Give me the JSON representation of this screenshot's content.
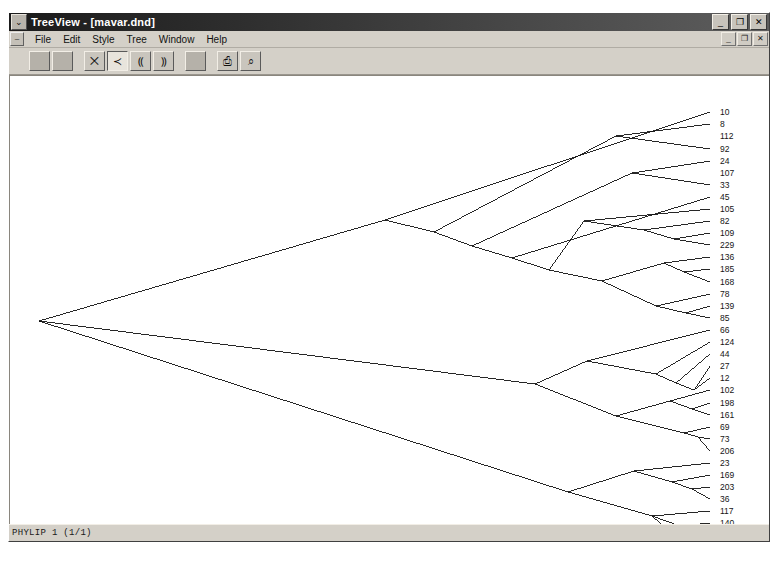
{
  "window": {
    "title": "TreeView - [mavar.dnd]",
    "app_name": "TreeView",
    "document_name": "mavar.dnd",
    "sysmenu_glyph": "⌄",
    "controls": [
      {
        "name": "minimize",
        "glyph": "_"
      },
      {
        "name": "restore",
        "glyph": "❐"
      },
      {
        "name": "close",
        "glyph": "✕"
      }
    ],
    "child_controls": [
      {
        "name": "child-minimize",
        "glyph": "_"
      },
      {
        "name": "child-restore",
        "glyph": "❐"
      },
      {
        "name": "child-close",
        "glyph": "✕"
      }
    ],
    "child_sysmenu_glyph": "–"
  },
  "menu": {
    "items": [
      {
        "label": "File"
      },
      {
        "label": "Edit"
      },
      {
        "label": "Style"
      },
      {
        "label": "Tree"
      },
      {
        "label": "Window"
      },
      {
        "label": "Help"
      }
    ]
  },
  "toolbar": {
    "buttons": [
      {
        "name": "tool-blank-1",
        "glyph": "",
        "kind": "blank",
        "pressed": false
      },
      {
        "name": "tool-blank-2",
        "glyph": "",
        "kind": "blank",
        "pressed": false
      },
      {
        "name": "tool-gap-1",
        "glyph": "",
        "kind": "gap",
        "pressed": false
      },
      {
        "name": "tool-unrooted-tree",
        "glyph": "⨉",
        "kind": "icon",
        "pressed": false
      },
      {
        "name": "tool-slanted-cladogram",
        "glyph": "≺",
        "kind": "icon",
        "pressed": true
      },
      {
        "name": "tool-rectangular-cladogram",
        "glyph": "⸨",
        "kind": "icon",
        "pressed": false
      },
      {
        "name": "tool-phylogram",
        "glyph": "⸩",
        "kind": "icon",
        "pressed": false
      },
      {
        "name": "tool-gap-2",
        "glyph": "",
        "kind": "gap",
        "pressed": false
      },
      {
        "name": "tool-blank-3",
        "glyph": "",
        "kind": "blank",
        "pressed": false
      },
      {
        "name": "tool-gap-3",
        "glyph": "",
        "kind": "gap",
        "pressed": false
      },
      {
        "name": "tool-print",
        "glyph": "⎙",
        "kind": "icon",
        "pressed": false
      },
      {
        "name": "tool-print-preview",
        "glyph": "⌕",
        "kind": "icon",
        "pressed": false
      }
    ]
  },
  "status": {
    "text": "PHYLIP 1 (1/1)"
  },
  "chart_data": {
    "type": "tree",
    "subtype": "slanted-cladogram",
    "title": "",
    "format": "PHYLIP",
    "tip_count": 42,
    "line_color": "#101010",
    "root": {
      "x": 35,
      "y": 305
    },
    "label_x": 716,
    "tip_x": 706,
    "first_tip_y": 96,
    "tip_spacing": 12.2,
    "tips": [
      "10",
      "8",
      "112",
      "92",
      "24",
      "107",
      "33",
      "45",
      "105",
      "82",
      "109",
      "229",
      "136",
      "185",
      "168",
      "78",
      "139",
      "85",
      "66",
      "124",
      "44",
      "27",
      "12",
      "102",
      "198",
      "161",
      "69",
      "73",
      "206",
      "23",
      "169",
      "203",
      "36",
      "117",
      "140",
      "219",
      "104",
      "228",
      "230"
    ],
    "tip_y": [
      96,
      108,
      120,
      133,
      145,
      157,
      169,
      181,
      193,
      205,
      217,
      229,
      241,
      253,
      266,
      278,
      290,
      302,
      314,
      326,
      338,
      350,
      362,
      374,
      387,
      399,
      411,
      423,
      435,
      447,
      459,
      471,
      483,
      495,
      507,
      519,
      531,
      543,
      555
    ],
    "edges": [
      [
        35,
        305,
        381,
        204
      ],
      [
        35,
        305,
        531,
        368
      ],
      [
        35,
        305,
        564,
        476
      ],
      [
        381,
        204,
        706,
        96
      ],
      [
        381,
        204,
        430,
        216
      ],
      [
        430,
        216,
        612,
        120
      ],
      [
        430,
        216,
        468,
        230
      ],
      [
        612,
        120,
        706,
        108
      ],
      [
        612,
        120,
        706,
        133
      ],
      [
        468,
        230,
        628,
        157
      ],
      [
        468,
        230,
        508,
        242
      ],
      [
        628,
        157,
        706,
        145
      ],
      [
        628,
        157,
        706,
        169
      ],
      [
        508,
        242,
        706,
        181
      ],
      [
        508,
        242,
        545,
        254
      ],
      [
        545,
        254,
        580,
        205
      ],
      [
        545,
        254,
        598,
        265
      ],
      [
        580,
        205,
        706,
        193
      ],
      [
        580,
        205,
        640,
        214
      ],
      [
        640,
        214,
        706,
        205
      ],
      [
        640,
        214,
        670,
        223
      ],
      [
        670,
        223,
        706,
        217
      ],
      [
        670,
        223,
        706,
        229
      ],
      [
        598,
        265,
        660,
        247
      ],
      [
        598,
        265,
        652,
        290
      ],
      [
        660,
        247,
        706,
        241
      ],
      [
        660,
        247,
        680,
        256
      ],
      [
        680,
        256,
        706,
        253
      ],
      [
        680,
        256,
        706,
        266
      ],
      [
        652,
        290,
        706,
        278
      ],
      [
        652,
        290,
        682,
        297
      ],
      [
        682,
        297,
        706,
        290
      ],
      [
        682,
        297,
        706,
        302
      ],
      [
        531,
        368,
        583,
        345
      ],
      [
        531,
        368,
        612,
        400
      ],
      [
        583,
        345,
        706,
        314
      ],
      [
        583,
        345,
        652,
        358
      ],
      [
        652,
        358,
        706,
        326
      ],
      [
        652,
        358,
        672,
        367
      ],
      [
        672,
        367,
        706,
        338
      ],
      [
        672,
        367,
        690,
        374
      ],
      [
        690,
        374,
        706,
        350
      ],
      [
        690,
        374,
        706,
        362
      ],
      [
        612,
        400,
        666,
        385
      ],
      [
        612,
        400,
        680,
        417
      ],
      [
        666,
        385,
        706,
        374
      ],
      [
        666,
        385,
        688,
        393
      ],
      [
        688,
        393,
        706,
        387
      ],
      [
        688,
        393,
        706,
        399
      ],
      [
        680,
        417,
        706,
        411
      ],
      [
        680,
        417,
        694,
        421
      ],
      [
        694,
        421,
        706,
        423
      ],
      [
        694,
        421,
        706,
        435
      ],
      [
        564,
        476,
        630,
        455
      ],
      [
        564,
        476,
        648,
        500
      ],
      [
        630,
        455,
        706,
        447
      ],
      [
        630,
        455,
        668,
        466
      ],
      [
        668,
        466,
        706,
        459
      ],
      [
        668,
        466,
        688,
        473
      ],
      [
        688,
        473,
        706,
        471
      ],
      [
        688,
        473,
        706,
        483
      ],
      [
        648,
        500,
        706,
        495
      ],
      [
        648,
        500,
        676,
        510
      ],
      [
        676,
        510,
        706,
        507
      ],
      [
        676,
        510,
        692,
        518
      ],
      [
        692,
        518,
        706,
        519
      ],
      [
        692,
        518,
        706,
        531
      ],
      [
        648,
        500,
        690,
        536
      ],
      [
        690,
        536,
        706,
        543
      ],
      [
        690,
        536,
        706,
        555
      ]
    ]
  }
}
